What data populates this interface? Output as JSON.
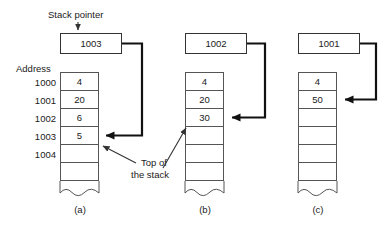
{
  "figure": {
    "labels": {
      "stack_pointer": "Stack pointer",
      "address": "Address",
      "top_of_line1": "Top of",
      "top_of_line2": "the stack"
    },
    "addresses": [
      "1000",
      "1001",
      "1002",
      "1003",
      "1004"
    ],
    "panels": [
      {
        "caption": "(a)",
        "pointer_value": "1003",
        "cells": [
          "4",
          "20",
          "6",
          "5",
          "",
          ""
        ],
        "arrow_target_row": 3
      },
      {
        "caption": "(b)",
        "pointer_value": "1002",
        "cells": [
          "4",
          "20",
          "30",
          "",
          "",
          ""
        ],
        "arrow_target_row": 2
      },
      {
        "caption": "(c)",
        "pointer_value": "1001",
        "cells": [
          "4",
          "50",
          "",
          "",
          "",
          ""
        ],
        "arrow_target_row": 1
      }
    ],
    "colors": {
      "background": "#ffffff",
      "line": "#333333",
      "cell_border": "#555555",
      "thick_connector": "#111111",
      "text": "#1a1a1a"
    }
  }
}
